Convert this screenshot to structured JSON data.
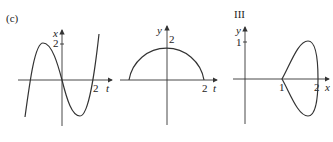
{
  "panels": [
    {
      "id": "c",
      "label": "(c)",
      "vertical_axis": "x",
      "horizontal_axis": "t",
      "v_tick": "2",
      "h_tick": "2",
      "curve": "cubic-like oscillation through origin"
    },
    {
      "id": "semicircle",
      "label": "",
      "vertical_axis": "y",
      "horizontal_axis": "t",
      "v_tick": "2",
      "h_tick": "2",
      "curve": "upper semicircle radius 2"
    },
    {
      "id": "III",
      "label": "III",
      "vertical_axis": "y",
      "horizontal_axis": "x",
      "v_tick": "1",
      "h_tick_1": "1",
      "h_tick_2": "2",
      "curve": "closed loop with cusp at x=1"
    }
  ]
}
